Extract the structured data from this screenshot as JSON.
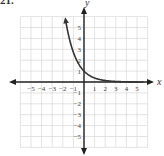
{
  "problem_number": "21.",
  "chart_data": {
    "type": "line",
    "title": "",
    "xlabel": "x",
    "ylabel": "y",
    "xlim": [
      -6,
      6
    ],
    "ylim": [
      -6,
      6
    ],
    "grid": true,
    "x_ticks": [
      -5,
      -4,
      -3,
      -2,
      -1,
      1,
      2,
      3,
      4,
      5
    ],
    "y_ticks": [
      -5,
      -4,
      -3,
      -2,
      -1,
      1,
      2,
      3,
      4,
      5
    ],
    "x_tick_labels": [
      "−5",
      "−4",
      "−3",
      "−2",
      "−1",
      "1",
      "2",
      "3",
      "4",
      "5"
    ],
    "y_tick_labels": [
      "−5",
      "−4",
      "−3",
      "−2",
      "−1",
      "1",
      "2",
      "3",
      "4",
      "5"
    ],
    "series": [
      {
        "name": "exponential decay curve",
        "function": "y = e^(-x)",
        "x": [
          -1.75,
          -1.5,
          -1,
          -0.5,
          0,
          0.5,
          1,
          1.5,
          2,
          2.5,
          3,
          4,
          5
        ],
        "y": [
          5.75,
          4.48,
          2.72,
          1.65,
          1.0,
          0.61,
          0.37,
          0.22,
          0.14,
          0.08,
          0.05,
          0.02,
          0.01
        ],
        "arrow_start": true,
        "color": "#333333"
      }
    ],
    "axis_color": "#222222",
    "grid_color": "#d0d0d0"
  }
}
